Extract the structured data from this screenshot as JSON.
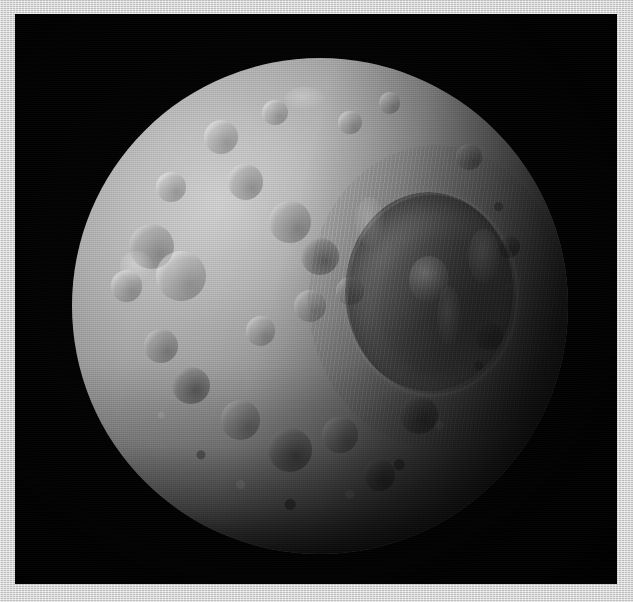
{
  "image": {
    "domain": "Natural-Image",
    "subject": "Mimas",
    "description": "Heavily cratered icy moon photographed against black space, with the giant Herschel impact crater near the day-night terminator on the right side.",
    "alt_text": "Grayscale photograph of Saturn's moon Mimas showing a densely cratered surface and the large Herschel crater",
    "width_px": 633,
    "height_px": 602
  },
  "frame": {
    "kind": "photo-mat-border",
    "color": "#d2d2d2",
    "border_left_px": 15,
    "border_top_px": 14,
    "border_right_px": 16,
    "border_bottom_px": 18
  },
  "plate": {
    "background_color": "#000000",
    "left_px": 15,
    "top_px": 14,
    "width_px": 602,
    "height_px": 570
  },
  "body": {
    "name": "moon-disk",
    "center_x_px": 320,
    "center_y_px": 306,
    "radius_px": 248,
    "lit_side": "left",
    "terminator_side": "right",
    "surface_tone_light": "#cfcfcf",
    "surface_tone_mid": "#909090",
    "surface_tone_dark": "#2a2a2a",
    "shadow_color": "#050505"
  },
  "herschel": {
    "name": "Herschel crater",
    "center_x_pct": 72,
    "center_y_pct": 44,
    "diameter_pct": 34,
    "floor_tone": "#4e4e4e",
    "rim_tone": "#c8c8c8",
    "has_central_peak": true
  },
  "craters": [
    {
      "name": "bright-crater-upper-left",
      "cx": 30,
      "cy": 16,
      "r": 3.4,
      "tone": "bright"
    },
    {
      "name": "bright-crater-upper-mid",
      "cx": 41,
      "cy": 11,
      "r": 2.6,
      "tone": "bright"
    },
    {
      "name": "bright-crater-upper-right",
      "cx": 56,
      "cy": 13,
      "r": 2.4,
      "tone": "bright"
    },
    {
      "name": "bright-crater-rim-north",
      "cx": 64,
      "cy": 9,
      "r": 2.2,
      "tone": "bright"
    },
    {
      "name": "crater-north-west-rim",
      "cx": 20,
      "cy": 26,
      "r": 3.0,
      "tone": "bright"
    },
    {
      "name": "crater-west-large",
      "cx": 16,
      "cy": 38,
      "r": 4.6,
      "tone": "mixed"
    },
    {
      "name": "crater-west-pair-a",
      "cx": 11,
      "cy": 46,
      "r": 3.2,
      "tone": "bright"
    },
    {
      "name": "crater-center-left-bright",
      "cx": 22,
      "cy": 44,
      "r": 5.0,
      "tone": "bright"
    },
    {
      "name": "crater-center-ring",
      "cx": 35,
      "cy": 25,
      "r": 3.6,
      "tone": "mixed"
    },
    {
      "name": "crater-center-shallow",
      "cx": 44,
      "cy": 33,
      "r": 4.2,
      "tone": "mixed"
    },
    {
      "name": "crater-center-dark",
      "cx": 50,
      "cy": 40,
      "r": 3.8,
      "tone": "dark"
    },
    {
      "name": "crater-mid-bright-a",
      "cx": 48,
      "cy": 50,
      "r": 3.2,
      "tone": "bright"
    },
    {
      "name": "crater-mid-bright-b",
      "cx": 56,
      "cy": 47,
      "r": 2.8,
      "tone": "bright"
    },
    {
      "name": "crater-mid-bright-c",
      "cx": 38,
      "cy": 55,
      "r": 3.0,
      "tone": "bright"
    },
    {
      "name": "crater-south-west-a",
      "cx": 18,
      "cy": 58,
      "r": 3.4,
      "tone": "mixed"
    },
    {
      "name": "crater-south-west-b",
      "cx": 24,
      "cy": 66,
      "r": 3.8,
      "tone": "dark"
    },
    {
      "name": "crater-south-a",
      "cx": 34,
      "cy": 73,
      "r": 4.0,
      "tone": "mixed"
    },
    {
      "name": "crater-south-b",
      "cx": 44,
      "cy": 79,
      "r": 4.4,
      "tone": "dark"
    },
    {
      "name": "crater-south-c",
      "cx": 54,
      "cy": 76,
      "r": 3.6,
      "tone": "mixed"
    },
    {
      "name": "crater-south-d",
      "cx": 62,
      "cy": 84,
      "r": 3.2,
      "tone": "dark"
    },
    {
      "name": "crater-south-east",
      "cx": 70,
      "cy": 72,
      "r": 3.8,
      "tone": "dark"
    },
    {
      "name": "crater-east-small-a",
      "cx": 84,
      "cy": 56,
      "r": 2.8,
      "tone": "dark"
    },
    {
      "name": "crater-east-small-b",
      "cx": 88,
      "cy": 38,
      "r": 2.4,
      "tone": "dark"
    },
    {
      "name": "crater-north-east-limb",
      "cx": 80,
      "cy": 20,
      "r": 2.6,
      "tone": "mixed"
    }
  ],
  "bright_spots": [
    {
      "name": "albedo-spot-herschel-west-rim",
      "cx": 60,
      "cy": 33,
      "rx": 3.0,
      "ry": 5.0,
      "opacity": 0.3
    },
    {
      "name": "albedo-spot-herschel-east-rim",
      "cx": 83,
      "cy": 40,
      "rx": 3.2,
      "ry": 5.5,
      "opacity": 0.26
    },
    {
      "name": "albedo-spot-north-limb",
      "cx": 47,
      "cy": 8,
      "rx": 4.0,
      "ry": 2.2,
      "opacity": 0.24
    },
    {
      "name": "albedo-spot-west-bright",
      "cx": 13,
      "cy": 42,
      "rx": 3.4,
      "ry": 3.0,
      "opacity": 0.3
    },
    {
      "name": "albedo-spot-terminator-ridge",
      "cx": 76,
      "cy": 52,
      "rx": 2.4,
      "ry": 6.0,
      "opacity": 0.2
    }
  ]
}
